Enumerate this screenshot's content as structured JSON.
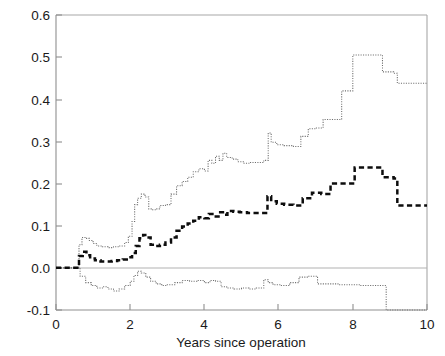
{
  "chart_data": {
    "type": "line",
    "subtype": "step-function",
    "title": "",
    "xlabel": "Years since operation",
    "ylabel": "",
    "xlim": [
      0,
      10
    ],
    "ylim": [
      -0.1,
      0.6
    ],
    "xticks": [
      0,
      2,
      4,
      6,
      8,
      10
    ],
    "xtick_labels": [
      "0",
      "2",
      "4",
      "6",
      "8",
      "10"
    ],
    "yticks": [
      -0.1,
      0.0,
      0.1,
      0.2,
      0.3,
      0.4,
      0.5,
      0.6
    ],
    "ytick_labels": [
      "-0.1",
      "0.0",
      "0.1",
      "0.2",
      "0.3",
      "0.4",
      "0.5",
      "0.6"
    ],
    "grid": false,
    "legend": "none",
    "annotations": [],
    "reference_lines": [
      {
        "name": "zero-line",
        "axis": "y",
        "value": 0.0
      }
    ],
    "series": [
      {
        "name": "upper-confidence-band",
        "style": "fine-dotted-step",
        "color": "#6e6e6e",
        "x": [
          0.0,
          0.55,
          0.62,
          0.7,
          0.8,
          0.9,
          1.0,
          1.1,
          1.25,
          1.4,
          1.55,
          1.7,
          1.85,
          1.95,
          2.05,
          2.12,
          2.2,
          2.3,
          2.4,
          2.5,
          2.6,
          2.7,
          2.8,
          2.95,
          3.1,
          3.25,
          3.4,
          3.55,
          3.7,
          3.85,
          4.0,
          4.1,
          4.2,
          4.3,
          4.4,
          4.5,
          4.6,
          4.75,
          4.9,
          5.05,
          5.2,
          5.4,
          5.6,
          5.72,
          5.8,
          5.95,
          6.15,
          6.4,
          6.6,
          6.8,
          7.0,
          7.2,
          7.45,
          7.7,
          8.0,
          8.4,
          8.8,
          9.1,
          9.2,
          10.0
        ],
        "y": [
          0.0,
          0.0,
          0.055,
          0.072,
          0.07,
          0.065,
          0.058,
          0.052,
          0.05,
          0.048,
          0.05,
          0.052,
          0.06,
          0.075,
          0.11,
          0.15,
          0.165,
          0.175,
          0.168,
          0.14,
          0.138,
          0.14,
          0.148,
          0.15,
          0.175,
          0.195,
          0.205,
          0.215,
          0.228,
          0.235,
          0.23,
          0.255,
          0.248,
          0.265,
          0.255,
          0.272,
          0.262,
          0.258,
          0.252,
          0.248,
          0.25,
          0.25,
          0.255,
          0.32,
          0.298,
          0.292,
          0.29,
          0.288,
          0.312,
          0.33,
          0.332,
          0.352,
          0.352,
          0.42,
          0.505,
          0.505,
          0.465,
          0.462,
          0.438,
          0.438
        ]
      },
      {
        "name": "estimate-curve",
        "style": "bold-dashed-step",
        "color": "#0d0d0d",
        "x": [
          0.0,
          0.55,
          0.62,
          0.72,
          0.82,
          0.92,
          1.05,
          1.2,
          1.35,
          1.5,
          1.65,
          1.8,
          1.95,
          2.05,
          2.15,
          2.25,
          2.35,
          2.45,
          2.55,
          2.68,
          2.8,
          2.95,
          3.1,
          3.25,
          3.4,
          3.55,
          3.7,
          3.85,
          4.0,
          4.12,
          4.25,
          4.38,
          4.5,
          4.62,
          4.78,
          4.95,
          5.15,
          5.35,
          5.55,
          5.7,
          5.8,
          5.95,
          6.15,
          6.4,
          6.65,
          6.9,
          7.15,
          7.4,
          7.7,
          8.05,
          8.45,
          8.8,
          9.1,
          9.2,
          10.0
        ],
        "y": [
          0.0,
          0.0,
          0.028,
          0.038,
          0.03,
          0.022,
          0.018,
          0.015,
          0.015,
          0.016,
          0.018,
          0.02,
          0.025,
          0.035,
          0.052,
          0.07,
          0.078,
          0.072,
          0.055,
          0.052,
          0.055,
          0.06,
          0.072,
          0.088,
          0.098,
          0.105,
          0.112,
          0.12,
          0.118,
          0.128,
          0.122,
          0.132,
          0.126,
          0.135,
          0.133,
          0.132,
          0.13,
          0.13,
          0.13,
          0.17,
          0.158,
          0.152,
          0.15,
          0.148,
          0.165,
          0.178,
          0.175,
          0.2,
          0.2,
          0.238,
          0.238,
          0.215,
          0.212,
          0.148,
          0.148
        ]
      },
      {
        "name": "lower-confidence-band",
        "style": "fine-dotted-step",
        "color": "#6e6e6e",
        "x": [
          0.0,
          0.55,
          0.65,
          0.8,
          0.95,
          1.1,
          1.25,
          1.4,
          1.55,
          1.7,
          1.85,
          2.0,
          2.1,
          2.2,
          2.3,
          2.42,
          2.55,
          2.7,
          2.85,
          3.0,
          3.2,
          3.4,
          3.6,
          3.8,
          4.0,
          4.15,
          4.3,
          4.45,
          4.6,
          4.8,
          5.0,
          5.2,
          5.4,
          5.6,
          5.72,
          5.85,
          6.05,
          6.3,
          6.55,
          6.8,
          7.05,
          7.3,
          7.6,
          7.9,
          8.2,
          8.55,
          8.9,
          9.1,
          9.2,
          10.0
        ],
        "y": [
          0.0,
          0.0,
          -0.02,
          -0.035,
          -0.042,
          -0.048,
          -0.045,
          -0.05,
          -0.055,
          -0.05,
          -0.042,
          -0.032,
          -0.018,
          -0.008,
          -0.012,
          -0.022,
          -0.032,
          -0.038,
          -0.042,
          -0.04,
          -0.035,
          -0.03,
          -0.032,
          -0.03,
          -0.035,
          -0.03,
          -0.032,
          -0.045,
          -0.048,
          -0.05,
          -0.048,
          -0.05,
          -0.048,
          -0.028,
          -0.035,
          -0.04,
          -0.042,
          -0.035,
          -0.022,
          -0.02,
          -0.038,
          -0.038,
          -0.04,
          -0.04,
          -0.042,
          -0.042,
          -0.1,
          -0.1,
          -0.1,
          -0.1
        ]
      }
    ]
  },
  "axes": {
    "x_axis_title": "Years since operation",
    "y_axis_title": ""
  }
}
